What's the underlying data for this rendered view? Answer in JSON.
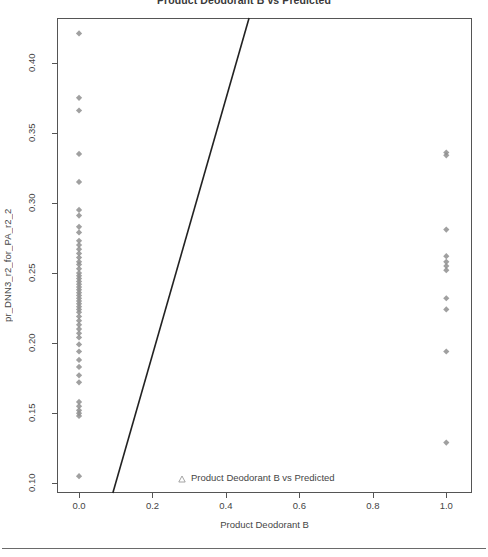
{
  "chart_data": {
    "type": "scatter",
    "title": "Product Deodorant B vs Predicted",
    "xlabel": "Product Deodorant B",
    "ylabel": "pr_DNN3_r2_for_PA_r2_2",
    "xlim": [
      -0.06,
      1.07
    ],
    "ylim": [
      0.093,
      0.432
    ],
    "xticks": [
      0.0,
      0.2,
      0.4,
      0.6,
      0.8,
      1.0
    ],
    "xtick_labels": [
      "0.0",
      "0.2",
      "0.4",
      "0.6",
      "0.8",
      "1.0"
    ],
    "yticks": [
      0.1,
      0.15,
      0.2,
      0.25,
      0.3,
      0.35,
      0.4
    ],
    "ytick_labels": [
      "0.10",
      "0.15",
      "0.20",
      "0.25",
      "0.30",
      "0.35",
      "0.40"
    ],
    "grid": false,
    "legend_position": "bottom-center",
    "legend": [
      {
        "label": "Product Deodorant B vs Predicted",
        "marker": "triangle",
        "color": "#8c8c8c"
      }
    ],
    "marker_style": "diamond",
    "marker_color": "#8f8f8f",
    "series": [
      {
        "name": "Product Deodorant B vs Predicted",
        "x": [
          0.0,
          0.0,
          0.0,
          0.0,
          0.0,
          0.0,
          0.0,
          0.0,
          0.0,
          0.0,
          0.0,
          0.0,
          0.0,
          0.0,
          0.0,
          0.0,
          0.0,
          0.0,
          0.0,
          0.0,
          0.0,
          0.0,
          0.0,
          0.0,
          0.0,
          0.0,
          0.0,
          0.0,
          0.0,
          0.0,
          0.0,
          0.0,
          0.0,
          0.0,
          0.0,
          0.0,
          0.0,
          0.0,
          0.0,
          0.0,
          0.0,
          0.0,
          0.0,
          0.0,
          0.0,
          0.0,
          0.0,
          0.0,
          0.0,
          0.0,
          1.0,
          1.0,
          1.0,
          1.0,
          1.0,
          1.0,
          1.0,
          1.0,
          1.0,
          1.0,
          1.0
        ],
        "y": [
          0.421,
          0.375,
          0.366,
          0.335,
          0.315,
          0.295,
          0.291,
          0.283,
          0.279,
          0.273,
          0.27,
          0.267,
          0.264,
          0.261,
          0.258,
          0.256,
          0.253,
          0.25,
          0.248,
          0.246,
          0.244,
          0.242,
          0.24,
          0.238,
          0.236,
          0.234,
          0.232,
          0.23,
          0.228,
          0.226,
          0.224,
          0.222,
          0.219,
          0.216,
          0.213,
          0.21,
          0.207,
          0.204,
          0.199,
          0.194,
          0.188,
          0.183,
          0.177,
          0.172,
          0.158,
          0.155,
          0.152,
          0.15,
          0.148,
          0.105,
          0.336,
          0.334,
          0.281,
          0.262,
          0.258,
          0.255,
          0.252,
          0.232,
          0.224,
          0.194,
          0.129
        ]
      }
    ],
    "fit_line": {
      "label": "regression line",
      "color": "#222222",
      "x_at_plot_bottom": 0.092,
      "x_at_plot_top": 0.463,
      "width_px": 1.6
    }
  }
}
